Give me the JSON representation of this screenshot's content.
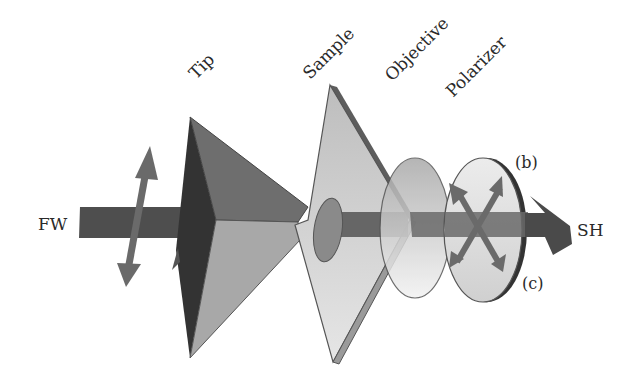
{
  "diagram": {
    "labels": {
      "tip": "Tip",
      "sample": "Sample",
      "objective": "Objective",
      "polarizer": "Polarizer",
      "fundamental_wave": "FW",
      "second_harmonic": "SH",
      "polarization_b": "(b)",
      "polarization_c": "(c)"
    },
    "components": [
      {
        "id": "tip",
        "shape": "pyramid"
      },
      {
        "id": "sample",
        "shape": "tilted-plate"
      },
      {
        "id": "objective",
        "shape": "lens-ellipse"
      },
      {
        "id": "polarizer",
        "shape": "disc-ellipse"
      }
    ],
    "colors": {
      "beam_dark": "#4a4a4a",
      "beam_mid": "#6b6b6b",
      "tip_dark": "#333333",
      "tip_mid": "#6e6e6e",
      "tip_light": "#a8a8a8",
      "sample_face": "#c8c8c8",
      "sample_edge": "#6a6a6a",
      "objective_fill": "#b5b5b5",
      "polarizer_fill": "#d8d8d8",
      "arrow": "#6a6a6a",
      "outline": "#555555"
    }
  }
}
